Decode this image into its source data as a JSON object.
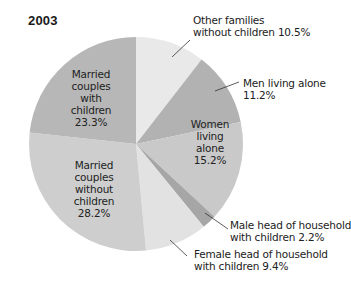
{
  "chart_data": {
    "type": "pie",
    "title": "2003",
    "start_angle_deg": 0,
    "direction": "clockwise",
    "slices": [
      {
        "label": "Other families without children",
        "value": 10.5,
        "display": "10.5%",
        "color": "#e9e9e9"
      },
      {
        "label": "Men living alone",
        "value": 11.2,
        "display": "11.2%",
        "color": "#b2b2b2"
      },
      {
        "label": "Women living alone",
        "value": 15.2,
        "display": "15.2%",
        "color": "#c9c9c9"
      },
      {
        "label": "Male head of household with children",
        "value": 2.2,
        "display": "2.2%",
        "color": "#a6a6a6"
      },
      {
        "label": "Female head of household with children",
        "value": 9.4,
        "display": "9.4%",
        "color": "#e2e2e2"
      },
      {
        "label": "Married couples without children",
        "value": 28.2,
        "display": "28.2%",
        "color": "#cecece"
      },
      {
        "label": "Married couples with children",
        "value": 23.3,
        "display": "23.3%",
        "color": "#b7b7b7"
      }
    ]
  },
  "labels": {
    "title": "2003",
    "other_families": {
      "line1": "Other families",
      "line2": "without children 10.5%"
    },
    "men_alone": {
      "line1": "Men living alone",
      "line2": "11.2%"
    },
    "women_alone": {
      "line1": "Women",
      "line2": "living",
      "line3": "alone",
      "line4": "15.2%"
    },
    "male_head": {
      "line1": "Male head of household",
      "line2": "with children 2.2%"
    },
    "female_head": {
      "line1": "Female head of household",
      "line2": "with children 9.4%"
    },
    "married_without": {
      "line1": "Married",
      "line2": "couples",
      "line3": "without",
      "line4": "children",
      "line5": "28.2%"
    },
    "married_with": {
      "line1": "Married",
      "line2": "couples",
      "line3": "with",
      "line4": "children",
      "line5": "23.3%"
    }
  }
}
